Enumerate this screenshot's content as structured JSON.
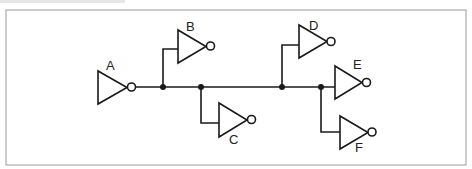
{
  "diagram": {
    "type": "logic-fanout",
    "colors": {
      "stroke": "#1a1a1a",
      "frame": "#9a9a9a",
      "background": "#ffffff"
    },
    "gates": [
      {
        "id": "A",
        "label": "A",
        "kind": "inverter",
        "role": "driver"
      },
      {
        "id": "B",
        "label": "B",
        "kind": "inverter",
        "role": "load"
      },
      {
        "id": "C",
        "label": "C",
        "kind": "inverter",
        "role": "load"
      },
      {
        "id": "D",
        "label": "D",
        "kind": "inverter",
        "role": "load"
      },
      {
        "id": "E",
        "label": "E",
        "kind": "inverter",
        "role": "load"
      },
      {
        "id": "F",
        "label": "F",
        "kind": "inverter",
        "role": "load"
      }
    ],
    "connections": [
      {
        "from": "A",
        "to": "B"
      },
      {
        "from": "A",
        "to": "C"
      },
      {
        "from": "A",
        "to": "D"
      },
      {
        "from": "A",
        "to": "E"
      },
      {
        "from": "A",
        "to": "F"
      }
    ]
  }
}
